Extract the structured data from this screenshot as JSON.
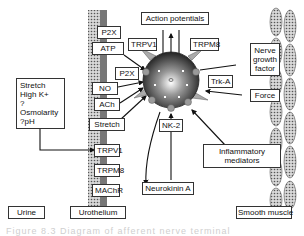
{
  "diagram": {
    "nodes": {
      "action_potentials": "Action potentials",
      "p2x_top": "P2X",
      "atp": "ATP",
      "trpv1_top": "TRPV1",
      "trpm8_top": "TRPM8",
      "p2x_mid": "P2X",
      "no": "NO",
      "ach": "ACh",
      "stretch_uro": "Stretch",
      "trpv1_uro": "TRPV1",
      "trpm8_uro": "TRPM8",
      "machr": "MAChR",
      "trk_a": "Trk-A",
      "nerve_growth_factor_line1": "Nerve",
      "nerve_growth_factor_line2": "growth",
      "nerve_growth_factor_line3": "factor",
      "force": "Force",
      "nk2": "NK-2",
      "inflammatory_line1": "Inflammatory",
      "inflammatory_line2": "mediators",
      "neurokinin_a": "Neurokinin A",
      "stimuli_line1": "Stretch",
      "stimuli_line2": "High K+",
      "stimuli_line3": "?Osmolarity",
      "stimuli_line4": "?pH"
    },
    "region_labels": {
      "urine": "Urine",
      "urothelium": "Urothelium",
      "smooth_muscle": "Smooth muscle"
    },
    "caption": "Figure 8.3  Diagram of afferent nerve terminal"
  }
}
